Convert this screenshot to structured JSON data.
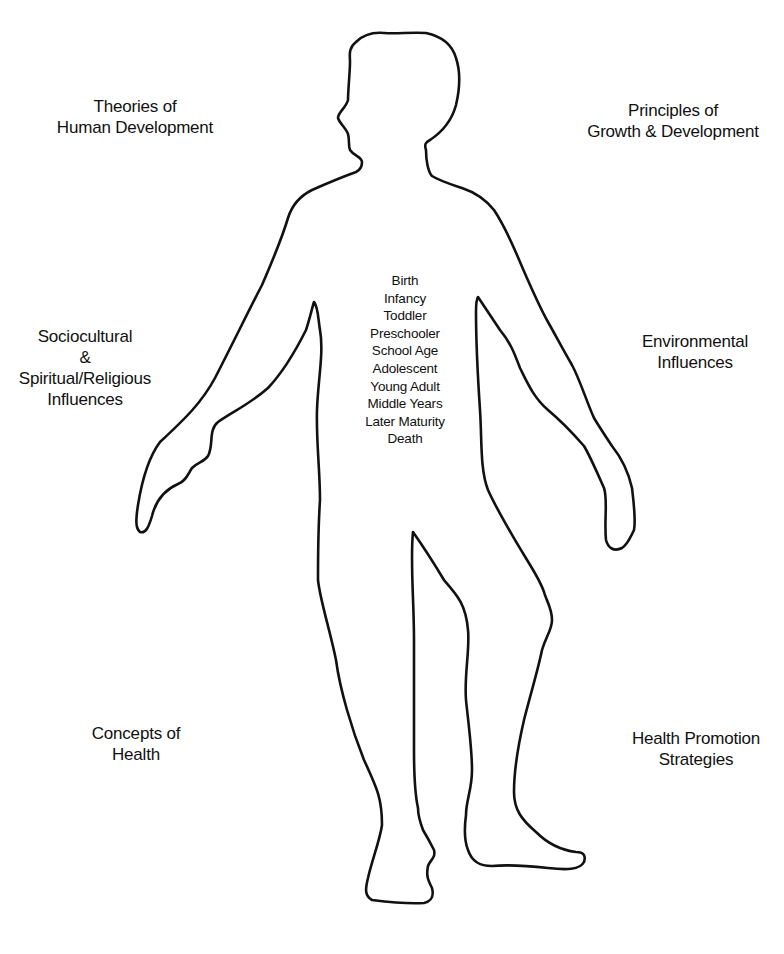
{
  "diagram": {
    "type": "human-figure-outline",
    "outline_color": "#111111",
    "background_color": "#ffffff"
  },
  "labels": {
    "top_left": {
      "lines": [
        "Theories of",
        "Human Development"
      ]
    },
    "top_right": {
      "lines": [
        "Principles of",
        "Growth & Development"
      ]
    },
    "middle_left": {
      "lines": [
        "Sociocultural",
        "&",
        "Spiritual/Religious",
        "Influences"
      ]
    },
    "middle_right": {
      "lines": [
        "Environmental",
        "Influences"
      ]
    },
    "bottom_left": {
      "lines": [
        "Concepts of",
        "Health"
      ]
    },
    "bottom_right": {
      "lines": [
        "Health Promotion",
        "Strategies"
      ]
    }
  },
  "life_stages": [
    "Birth",
    "Infancy",
    "Toddler",
    "Preschooler",
    "School Age",
    "Adolescent",
    "Young Adult",
    "Middle Years",
    "Later Maturity",
    "Death"
  ]
}
